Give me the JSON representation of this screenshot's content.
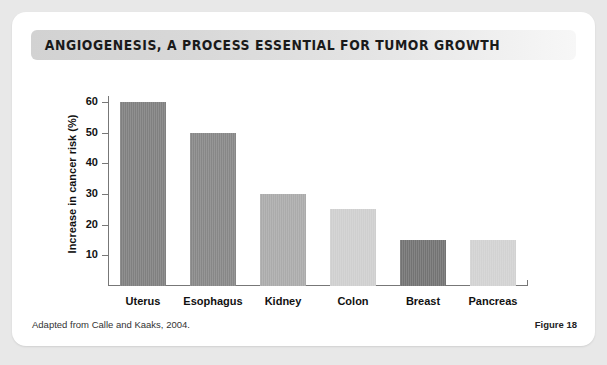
{
  "card": {
    "title": "ANGIOGENESIS, A PROCESS ESSENTIAL FOR TUMOR GROWTH"
  },
  "footer": {
    "source": "Adapted from Calle and Kaaks, 2004.",
    "figure": "Figure 18"
  },
  "chart_data": {
    "type": "bar",
    "title": "ANGIOGENESIS, A PROCESS ESSENTIAL FOR TUMOR GROWTH",
    "xlabel": "",
    "ylabel": "Increase in cancer risk (%)",
    "categories": [
      "Uterus",
      "Esophagus",
      "Kidney",
      "Colon",
      "Breast",
      "Pancreas"
    ],
    "values": [
      60,
      50,
      30,
      25,
      15,
      15
    ],
    "colors": [
      "#808080",
      "#878787",
      "#ababab",
      "#cfcfcf",
      "#737373",
      "#d2d2d2"
    ],
    "ylim": [
      0,
      62
    ],
    "yticks": [
      10,
      20,
      30,
      40,
      50,
      60
    ],
    "ytick_labels": [
      "10",
      "20",
      "30",
      "40",
      "50",
      "60"
    ],
    "grid": false,
    "legend": false
  }
}
